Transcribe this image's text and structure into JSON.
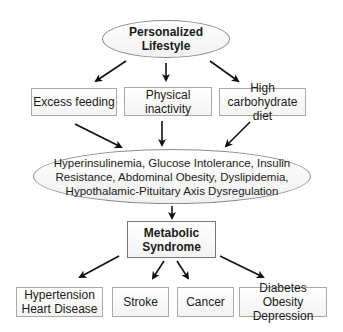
{
  "diagram": {
    "top": {
      "label": "Personalized Lifestyle"
    },
    "causes": [
      {
        "label": "Excess feeding"
      },
      {
        "label": "Physical inactivity"
      },
      {
        "label": "High carbohydrate diet"
      }
    ],
    "mechanisms": {
      "lines": [
        "Hyperinsulinemia, Glucose Intolerance, Insulin",
        "Resistance, Abdominal Obesity, Dyslipidemia,",
        "Hypothalamic-Pituitary Axis Dysregulation"
      ]
    },
    "syndrome": {
      "line1": "Metabolic",
      "line2": "Syndrome"
    },
    "outcomes": [
      {
        "line1": "Hypertension",
        "line2": "Heart Disease"
      },
      {
        "line1": "Stroke",
        "line2": ""
      },
      {
        "line1": "Cancer",
        "line2": ""
      },
      {
        "line1": "Diabetes Obesity",
        "line2": "Depression"
      }
    ],
    "edges": [
      [
        "Personalized Lifestyle",
        "Excess feeding"
      ],
      [
        "Personalized Lifestyle",
        "Physical inactivity"
      ],
      [
        "Personalized Lifestyle",
        "High carbohydrate diet"
      ],
      [
        "Excess feeding",
        "Mechanisms"
      ],
      [
        "Physical inactivity",
        "Mechanisms"
      ],
      [
        "High carbohydrate diet",
        "Mechanisms"
      ],
      [
        "Mechanisms",
        "Metabolic Syndrome"
      ],
      [
        "Metabolic Syndrome",
        "Hypertension Heart Disease"
      ],
      [
        "Metabolic Syndrome",
        "Stroke"
      ],
      [
        "Metabolic Syndrome",
        "Cancer"
      ],
      [
        "Metabolic Syndrome",
        "Diabetes Obesity Depression"
      ]
    ]
  }
}
